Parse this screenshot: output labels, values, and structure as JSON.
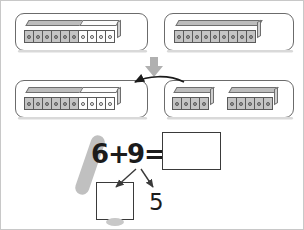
{
  "worksheet": {
    "title": "Make a ten strategy with snap cubes",
    "equation": {
      "addend_one": "6",
      "plus_sign": "+",
      "addend_two": "9",
      "equals_sign": "=",
      "sum_value": "",
      "sum_placeholder": ""
    },
    "decomposition": {
      "part_one_value": "",
      "part_one_placeholder": "",
      "part_two_value": "5"
    }
  },
  "step_one": {
    "left_panel": {
      "label": "ten-frame-train",
      "filled_cubes": 6,
      "empty_cubes": 4,
      "total_cubes": 10,
      "filled_color": "#c4c4c4",
      "empty_color": "#fdfdfd"
    },
    "right_panel": {
      "label": "nine-train",
      "filled_cubes": 9,
      "filled_color": "#c4c4c4"
    }
  },
  "transition": {
    "icon": "down-arrow-icon",
    "color": "#b0b0b0"
  },
  "step_two": {
    "left_panel": {
      "label": "ten-frame-train-after",
      "filled_cubes": 6,
      "empty_cubes": 4,
      "total_cubes": 10
    },
    "right_panel": {
      "label": "split-nine-train",
      "group_one_cubes": 4,
      "group_two_cubes": 5
    },
    "move_arrow": {
      "icon": "curved-move-arrow-icon",
      "color": "#1b1b1b"
    }
  },
  "branch_arrows": {
    "left": "branch-arrow-left-icon",
    "right": "branch-arrow-right-icon",
    "color": "#3a3a3a"
  },
  "marker": {
    "icon": "highlighter-marker-icon",
    "color": "#c0c0c0"
  }
}
